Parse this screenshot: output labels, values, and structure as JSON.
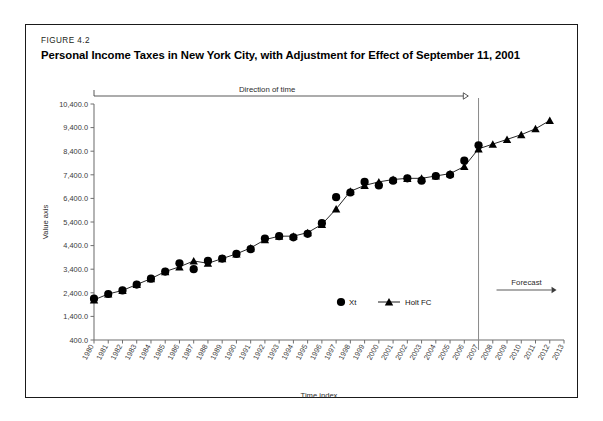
{
  "figure": {
    "number": "FIGURE 4.2",
    "title": "Personal Income Taxes in New York City, with Adjustment for Effect of September 11, 2001"
  },
  "annotations": {
    "direction_of_time": "Direction of time",
    "forecast": "Forecast"
  },
  "legend": {
    "items": [
      {
        "label": "Xt",
        "marker": "circle-marker"
      },
      {
        "label": "Holt FC",
        "marker": "triangle-line-marker"
      }
    ]
  },
  "chart_data": {
    "type": "line",
    "title": "Personal Income Taxes in New York City, with Adjustment for Effect of September 11, 2001",
    "xlabel": "Time index",
    "ylabel": "Value axis",
    "ylim": [
      400.0,
      10400.0
    ],
    "ytick_step": 1000,
    "ytick_labels": [
      "400.0",
      "1,400.0",
      "2,400.0",
      "3,400.0",
      "4,400.0",
      "5,400.0",
      "6,400.0",
      "7,400.0",
      "8,400.0",
      "9,400.0",
      "10,400.0"
    ],
    "grid": false,
    "legend_position": "inside-bottom-right",
    "forecast_divider_x": "2007",
    "categories": [
      "1980",
      "1981",
      "1982",
      "1983",
      "1984",
      "1985",
      "1986",
      "1987",
      "1988",
      "1989",
      "1990",
      "1991",
      "1992",
      "1993",
      "1994",
      "1995",
      "1996",
      "1997",
      "1998",
      "1999",
      "2000",
      "2001",
      "2002",
      "2003",
      "2004",
      "2005",
      "2006",
      "2007",
      "2008",
      "2009",
      "2010",
      "2011",
      "2012",
      "2013"
    ],
    "series": [
      {
        "name": "Xt",
        "marker": "circle",
        "values": [
          2150,
          2350,
          2500,
          2750,
          3000,
          3300,
          3650,
          3400,
          3750,
          3850,
          4050,
          4250,
          4700,
          4800,
          4750,
          4900,
          5350,
          6450,
          6650,
          7100,
          6950,
          7150,
          7250,
          7150,
          7350,
          7400,
          8000,
          8650,
          null,
          null,
          null,
          null,
          null,
          null
        ]
      },
      {
        "name": "Holt FC",
        "marker": "triangle",
        "values": [
          2100,
          2350,
          2500,
          2750,
          3000,
          3300,
          3500,
          3750,
          3650,
          3850,
          4050,
          4300,
          4650,
          4800,
          4800,
          4950,
          5300,
          5950,
          6700,
          6950,
          7100,
          7200,
          7250,
          7250,
          7350,
          7450,
          7750,
          8500,
          8700,
          8900,
          9100,
          9350,
          9700,
          null
        ]
      }
    ]
  }
}
